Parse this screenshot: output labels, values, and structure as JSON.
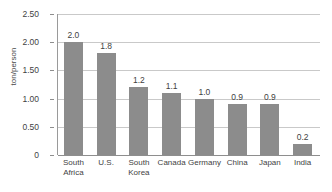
{
  "chart_data": {
    "type": "bar",
    "title": "",
    "xlabel": "",
    "ylabel": "ton/person",
    "categories": [
      "South Africa",
      "U.S.",
      "South Korea",
      "Canada",
      "Germany",
      "China",
      "Japan",
      "India"
    ],
    "values": [
      2.0,
      1.8,
      1.2,
      1.1,
      1.0,
      0.9,
      0.9,
      0.2
    ],
    "value_labels": [
      "2.0",
      "1.8",
      "1.2",
      "1.1",
      "1.0",
      "0.9",
      "0.9",
      "0.2"
    ],
    "ylim": [
      0,
      2.5
    ],
    "yticks": [
      0,
      0.5,
      1.0,
      1.5,
      2.0,
      2.5
    ],
    "ytick_labels": [
      "0",
      "0.50",
      "1.00",
      "1.50",
      "2.00",
      "2.50"
    ],
    "grid": true,
    "legend": "none",
    "bar_color": "#8c8c8c",
    "grid_color": "#c9c9c9",
    "axis_color": "#8e8e8e"
  }
}
